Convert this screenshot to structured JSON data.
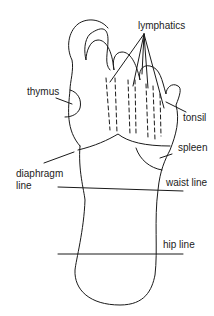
{
  "diagram": {
    "labels": {
      "lymphatics": "lymphatics",
      "thymus": "thymus",
      "tonsil": "tonsil",
      "spleen": "spleen",
      "diaphragm_line_1": "diaphragm",
      "diaphragm_line_2": "line",
      "waist_line": "waist line",
      "hip_line": "hip line"
    },
    "colors": {
      "stroke": "#1a1a1a",
      "background": "#ffffff"
    }
  }
}
